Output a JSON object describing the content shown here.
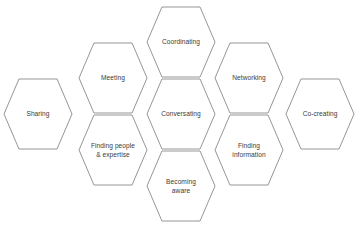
{
  "diagram": {
    "type": "honeycomb-hexagon-diagram",
    "background_color": "#ffffff",
    "stroke_color": "#8a8a8a",
    "label_color": "#3a3a3a",
    "hex_width": 68,
    "hex_height": 70,
    "cells": [
      {
        "id": "sharing",
        "name": "hex-cell-sharing",
        "lines": [
          "Sharing"
        ],
        "cx": 38,
        "cy": 114
      },
      {
        "id": "meeting",
        "name": "hex-cell-meeting",
        "lines": [
          "Meeting"
        ],
        "cx": 113,
        "cy": 78
      },
      {
        "id": "finding-people-expertise",
        "name": "hex-cell-finding-people-expertise",
        "lines": [
          "Finding people",
          "& expertise"
        ],
        "cx": 113,
        "cy": 150
      },
      {
        "id": "coordinating",
        "name": "hex-cell-coordinating",
        "lines": [
          "Coordinating"
        ],
        "cx": 181,
        "cy": 42
      },
      {
        "id": "conversating",
        "name": "hex-cell-conversating",
        "lines": [
          "Conversating"
        ],
        "cx": 181,
        "cy": 114
      },
      {
        "id": "becoming-aware",
        "name": "hex-cell-becoming-aware",
        "lines": [
          "Becoming",
          "aware"
        ],
        "cx": 181,
        "cy": 186
      },
      {
        "id": "networking",
        "name": "hex-cell-networking",
        "lines": [
          "Networking"
        ],
        "cx": 249,
        "cy": 78
      },
      {
        "id": "finding-information",
        "name": "hex-cell-finding-information",
        "lines": [
          "Finding",
          "information"
        ],
        "cx": 249,
        "cy": 150
      },
      {
        "id": "co-creating",
        "name": "hex-cell-co-creating",
        "lines": [
          "Co-creating"
        ],
        "cx": 320,
        "cy": 114
      }
    ]
  }
}
